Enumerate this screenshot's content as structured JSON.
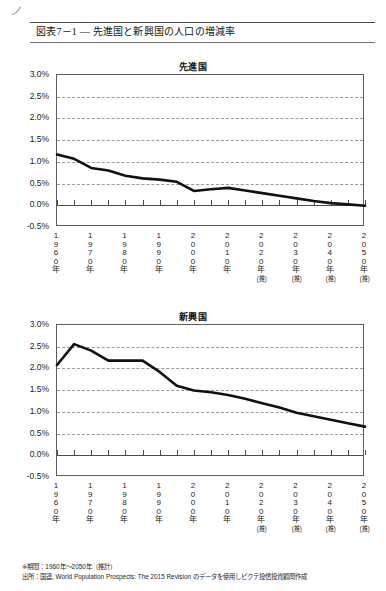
{
  "page": {
    "scrap_mark": "ノ",
    "figure_title": "図表7－1 ― 先進国と新興国の人口の増減率"
  },
  "notes": {
    "period": "※期間：1960年～2050年（推計）",
    "source": "出所：国連, World Population Prospects: The 2015 Revision のデータを使用しピクテ投信投資顧問作成"
  },
  "axis": {
    "y_ticks": [
      "3.0%",
      "2.5%",
      "2.0%",
      "1.5%",
      "1.0%",
      "0.5%",
      "0.0%",
      "-0.5%"
    ],
    "x_categories": [
      {
        "year": "1960",
        "unit": "年",
        "estimate": ""
      },
      {
        "year": "1970",
        "unit": "年",
        "estimate": ""
      },
      {
        "year": "1980",
        "unit": "年",
        "estimate": ""
      },
      {
        "year": "1990",
        "unit": "年",
        "estimate": ""
      },
      {
        "year": "2000",
        "unit": "年",
        "estimate": ""
      },
      {
        "year": "2010",
        "unit": "年",
        "estimate": ""
      },
      {
        "year": "2020",
        "unit": "年",
        "estimate": "(推)"
      },
      {
        "year": "2030",
        "unit": "年",
        "estimate": "(推)"
      },
      {
        "year": "2040",
        "unit": "年",
        "estimate": "(推)"
      },
      {
        "year": "2050",
        "unit": "年",
        "estimate": "(推)"
      }
    ]
  },
  "chart_data": [
    {
      "type": "line",
      "title": "先進国",
      "xlabel": "",
      "ylabel": "",
      "ylim": [
        -0.5,
        3.0
      ],
      "ytick_values": [
        3.0,
        2.5,
        2.0,
        1.5,
        1.0,
        0.5,
        0.0,
        -0.5
      ],
      "grid": true,
      "legend": "none",
      "x": [
        1960,
        1965,
        1970,
        1975,
        1980,
        1985,
        1990,
        1995,
        2000,
        2005,
        2010,
        2015,
        2020,
        2025,
        2030,
        2035,
        2040,
        2045,
        2050
      ],
      "values": [
        1.17,
        1.07,
        0.86,
        0.8,
        0.68,
        0.62,
        0.59,
        0.54,
        0.33,
        0.37,
        0.4,
        0.34,
        0.28,
        0.22,
        0.16,
        0.1,
        0.05,
        0.02,
        -0.01
      ]
    },
    {
      "type": "line",
      "title": "新興国",
      "xlabel": "",
      "ylabel": "",
      "ylim": [
        -0.5,
        3.0
      ],
      "ytick_values": [
        3.0,
        2.5,
        2.0,
        1.5,
        1.0,
        0.5,
        0.0,
        -0.5
      ],
      "grid": true,
      "legend": "none",
      "x": [
        1960,
        1965,
        1970,
        1975,
        1980,
        1985,
        1990,
        1995,
        2000,
        2005,
        2010,
        2015,
        2020,
        2025,
        2030,
        2035,
        2040,
        2045,
        2050
      ],
      "values": [
        2.08,
        2.56,
        2.41,
        2.18,
        2.18,
        2.18,
        1.92,
        1.6,
        1.49,
        1.45,
        1.39,
        1.3,
        1.2,
        1.1,
        0.98,
        0.9,
        0.82,
        0.74,
        0.66
      ]
    }
  ]
}
